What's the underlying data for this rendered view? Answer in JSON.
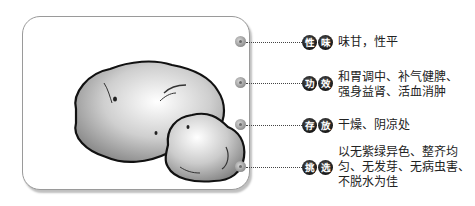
{
  "illustration": {
    "subject": "potato-illustration",
    "count": 2
  },
  "rows": [
    {
      "badge": [
        "性",
        "味"
      ],
      "lines": [
        "味甘，性平"
      ]
    },
    {
      "badge": [
        "功",
        "效"
      ],
      "lines": [
        "和胃调中、补气健脾、",
        "强身益肾、活血消肿"
      ]
    },
    {
      "badge": [
        "存",
        "放"
      ],
      "lines": [
        "干燥、阴凉处"
      ]
    },
    {
      "badge": [
        "挑",
        "选"
      ],
      "lines": [
        "以无紫绿异色、整齐均",
        "匀、无发芽、无病虫害、",
        "不脱水为佳"
      ]
    }
  ],
  "colors": {
    "badge": "#1a1a1a",
    "dot": "#a0a0a0",
    "border": "#9a9a9a",
    "text": "#222222"
  }
}
